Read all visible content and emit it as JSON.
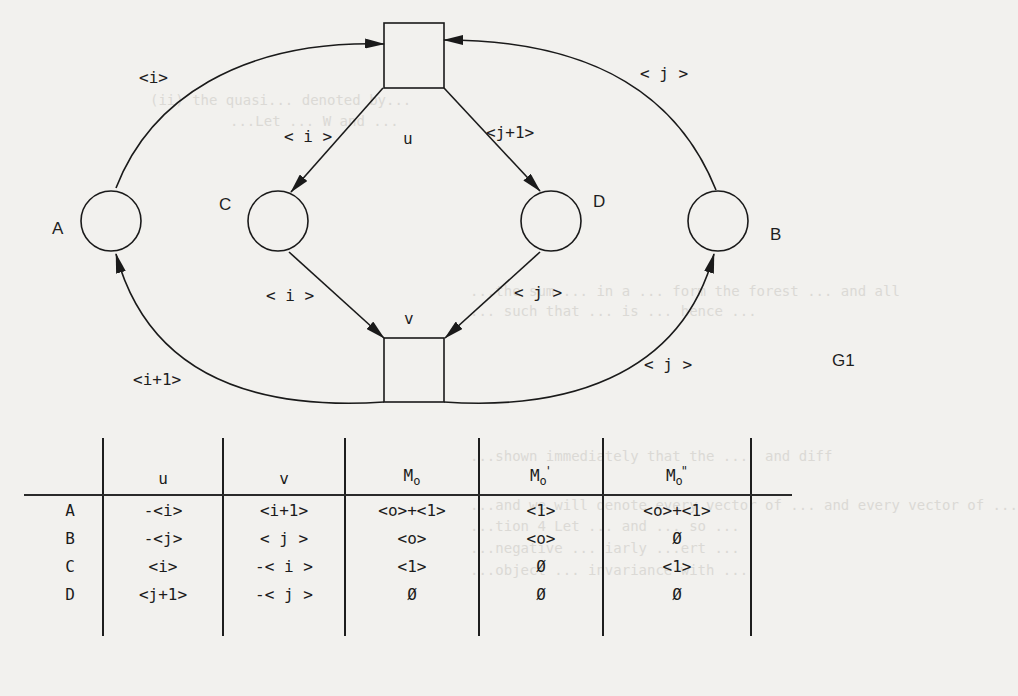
{
  "figure": {
    "label": "G1",
    "places": [
      {
        "id": "A",
        "label": "A"
      },
      {
        "id": "B",
        "label": "B"
      },
      {
        "id": "C",
        "label": "C"
      },
      {
        "id": "D",
        "label": "D"
      }
    ],
    "transitions": [
      {
        "id": "u",
        "label": "u"
      },
      {
        "id": "v",
        "label": "v"
      }
    ],
    "arcs": [
      {
        "from": "A",
        "to": "u",
        "label": "<i>"
      },
      {
        "from": "B",
        "to": "u",
        "label": "< j >"
      },
      {
        "from": "u",
        "to": "C",
        "label": "< i >"
      },
      {
        "from": "u",
        "to": "D",
        "label": "<j+1>"
      },
      {
        "from": "C",
        "to": "v",
        "label": "< i >"
      },
      {
        "from": "D",
        "to": "v",
        "label": "< j >"
      },
      {
        "from": "v",
        "to": "A",
        "label": "<i+1>"
      },
      {
        "from": "v",
        "to": "B",
        "label": "< j >"
      }
    ]
  },
  "table": {
    "headers": {
      "row": "",
      "u": "u",
      "v": "v",
      "m0": {
        "base": "M",
        "sub": "o",
        "prime": ""
      },
      "m1": {
        "base": "M",
        "sub": "o",
        "prime": "'"
      },
      "m2": {
        "base": "M",
        "sub": "o",
        "prime": "\""
      }
    },
    "rows": [
      {
        "place": "A",
        "u": "-<i>",
        "v": "<i+1>",
        "m0": "<o>+<1>",
        "m1": "<1>",
        "m2": "<o>+<1>"
      },
      {
        "place": "B",
        "u": "-<j>",
        "v": "< j >",
        "m0": "<o>",
        "m1": "<o>",
        "m2": "Ø"
      },
      {
        "place": "C",
        "u": "<i>",
        "v": "-< i >",
        "m0": "<1>",
        "m1": "Ø",
        "m2": "<1>"
      },
      {
        "place": "D",
        "u": "<j+1>",
        "v": "-< j >",
        "m0": "Ø",
        "m1": "Ø",
        "m2": "Ø"
      }
    ]
  },
  "bleed_through": [
    "(ii) the quasi... denoted by...",
    "...Let ... W and ...",
    "...the sum ... in a ... form the forest ... and all",
    "... such that ... is ... hence ...",
    "...shown immediately that the ...  and diff",
    "...and we will denote every vector of ... and every vector of ...",
    "...tion 4 Let ... and ... so ...",
    "...negative ... iarly ...ert ...",
    "...object ... invariance with ..."
  ]
}
